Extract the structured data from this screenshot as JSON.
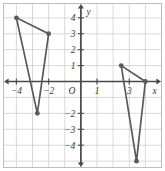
{
  "chart_data": {
    "type": "scatter",
    "title": "",
    "subtitle": "",
    "xlabel": "x",
    "ylabel": "y",
    "origin_label": "O",
    "xlim": [
      -4.8,
      5.0
    ],
    "ylim": [
      -5.4,
      4.9
    ],
    "grid": true,
    "grid_step": 1,
    "legend": "none",
    "x_ticks": [
      -4,
      -2,
      1,
      3
    ],
    "x_tick_labels": [
      "−4",
      "−2",
      "1",
      "3"
    ],
    "y_ticks": [
      4,
      3,
      2,
      1,
      -2,
      -3,
      -4
    ],
    "y_tick_labels": [
      "4",
      "3",
      "2",
      "1",
      "−2",
      "−3",
      "−4"
    ],
    "series": [
      {
        "name": "triangle-left",
        "type": "polygon",
        "closed": true,
        "points": [
          {
            "x": -4,
            "y": 4
          },
          {
            "x": -2,
            "y": 3
          },
          {
            "x": -2.7,
            "y": -2
          }
        ],
        "vertex_labels": [
          "(-4, 4)",
          "(-2, 3)",
          "(-2.7, -2)"
        ]
      },
      {
        "name": "triangle-right",
        "type": "polygon",
        "closed": true,
        "points": [
          {
            "x": 2.5,
            "y": 1
          },
          {
            "x": 4,
            "y": 0
          },
          {
            "x": 3.45,
            "y": -5
          }
        ],
        "vertex_labels": [
          "(2.5, 1)",
          "(4, 0)",
          "(3.45, -5)"
        ]
      }
    ],
    "colors": {
      "shape_stroke": "#595959",
      "vertex_fill": "#5a5a5a",
      "grid": "#c9c9c9",
      "axis": "#4a4a4a",
      "border": "#b8b8b8",
      "background": "#ffffff"
    }
  }
}
